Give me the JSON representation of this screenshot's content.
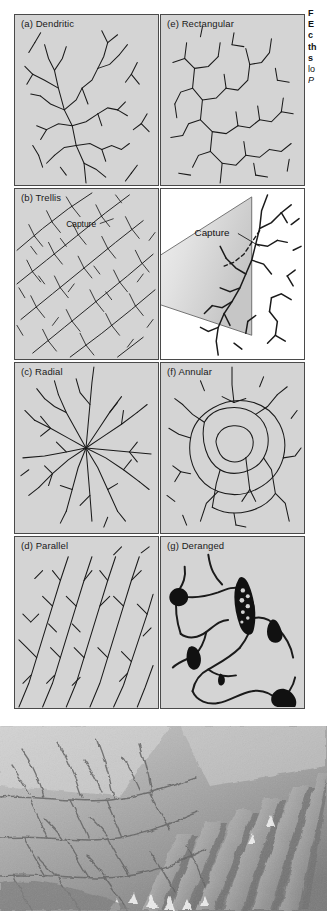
{
  "figure": {
    "caption_lines": [
      {
        "text": "F",
        "style": "bold"
      },
      {
        "text": "E",
        "style": "bold"
      },
      {
        "text": "c",
        "style": "bold"
      },
      {
        "text": "th",
        "style": "bold"
      },
      {
        "text": "s",
        "style": "bold"
      },
      {
        "text": "lo",
        "style": "normal"
      },
      {
        "text": "P",
        "style": "italic"
      },
      {
        "text": "P",
        "style": "normal"
      }
    ],
    "panels": [
      {
        "id": "a",
        "label": "(a) Dendritic",
        "pattern": "dendritic",
        "bg": "#d4d4d4"
      },
      {
        "id": "e",
        "label": "(e) Rectangular",
        "pattern": "rectangular",
        "bg": "#d4d4d4"
      },
      {
        "id": "b",
        "label": "(b) Trellis",
        "pattern": "trellis",
        "bg": "#d4d4d4"
      },
      {
        "id": "inset",
        "label": "",
        "pattern": "capture-inset",
        "bg": "#ffffff"
      },
      {
        "id": "c",
        "label": "(c) Radial",
        "pattern": "radial",
        "bg": "#d4d4d4"
      },
      {
        "id": "f",
        "label": "(f) Annular",
        "pattern": "annular",
        "bg": "#d4d4d4"
      },
      {
        "id": "d",
        "label": "(d) Parallel",
        "pattern": "parallel",
        "bg": "#d4d4d4"
      },
      {
        "id": "g",
        "label": "(g) Deranged",
        "pattern": "deranged",
        "bg": "#d4d4d4"
      }
    ],
    "annotations": {
      "capture_small": "Capture",
      "capture_inset": "Capture"
    },
    "photo": {
      "alt": "shaded-relief aerial photograph of dissected terrain with drainage channels"
    },
    "colors": {
      "panel_fill": "#d4d4d4",
      "panel_border": "#4a4a4a",
      "stream_line": "#1a1a1a",
      "inset_fill_light": "#f2f2f2",
      "inset_fill_dark": "#c9c9c9",
      "page_bg": "#ffffff"
    }
  }
}
